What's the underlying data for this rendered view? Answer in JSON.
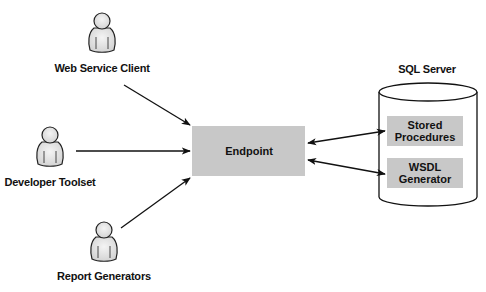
{
  "diagram": {
    "actors": [
      {
        "label": "Web Service Client",
        "icon": "user-icon"
      },
      {
        "label": "Developer Toolset",
        "icon": "user-icon"
      },
      {
        "label": "Report Generators",
        "icon": "user-icon"
      }
    ],
    "endpoint": {
      "label": "Endpoint"
    },
    "server": {
      "label": "SQL Server",
      "icon": "database-cylinder-icon",
      "components": [
        {
          "line1": "Stored",
          "line2": "Procedures"
        },
        {
          "line1": "WSDL",
          "line2": "Generator"
        }
      ]
    },
    "colors": {
      "box_fill": "#c8c8c8",
      "stroke": "#111111",
      "person_fill": "#e6e6e6"
    }
  }
}
